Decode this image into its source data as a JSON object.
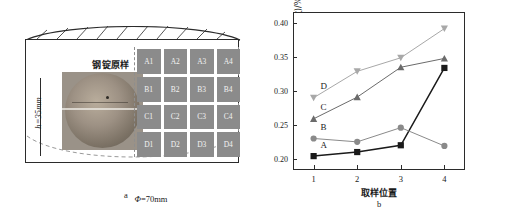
{
  "figure": {
    "panel_a": {
      "caption": "a",
      "sample_title": "钢锭原样",
      "height_label": "h=35mm",
      "diameter_label": "Φ=70mm",
      "diameter_symbol": "Φ",
      "diameter_value": "=70mm",
      "blocks": [
        "A1",
        "A2",
        "A3",
        "A4",
        "B1",
        "B2",
        "B3",
        "B4",
        "C1",
        "C2",
        "C3",
        "C4",
        "D1",
        "D2",
        "D3",
        "D4"
      ],
      "block_color": "#8b8b8b"
    },
    "panel_b": {
      "caption": "b"
    }
  },
  "chart_data": {
    "type": "line",
    "title": "",
    "xlabel": "取样位置",
    "ylabel": "氮含量(质量分数)/%",
    "categories": [
      1,
      2,
      3,
      4
    ],
    "xticklabels": [
      "1",
      "2",
      "3",
      "4"
    ],
    "yticklabels": [
      "0.20",
      "0.25",
      "0.30",
      "0.35",
      "0.40"
    ],
    "yticks": [
      0.2,
      0.25,
      0.3,
      0.35,
      0.4
    ],
    "ylim": [
      0.185,
      0.415
    ],
    "xlim": [
      0.55,
      4.45
    ],
    "grid": false,
    "legend": "inline-labels",
    "series": [
      {
        "name": "A",
        "marker": "square",
        "color": "#1a1a1a",
        "values": [
          0.204,
          0.21,
          0.22,
          0.334
        ]
      },
      {
        "name": "B",
        "marker": "circle",
        "color": "#8a8a8a",
        "values": [
          0.23,
          0.225,
          0.246,
          0.219
        ]
      },
      {
        "name": "C",
        "marker": "triangle-up",
        "color": "#6b6b6b",
        "values": [
          0.259,
          0.291,
          0.335,
          0.348
        ]
      },
      {
        "name": "D",
        "marker": "triangle-down",
        "color": "#a8a8a8",
        "values": [
          0.29,
          0.329,
          0.349,
          0.392
        ]
      }
    ]
  }
}
